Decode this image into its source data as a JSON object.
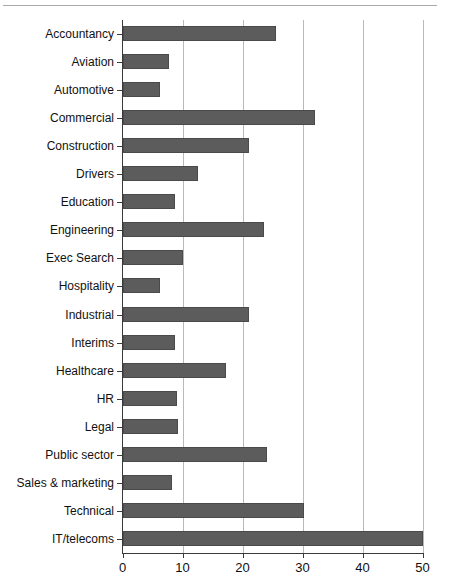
{
  "chart_data": {
    "type": "bar",
    "orientation": "horizontal",
    "title": "",
    "xlabel": "",
    "ylabel": "",
    "xlim": [
      0,
      50
    ],
    "xticks": [
      0,
      10,
      20,
      30,
      40,
      50
    ],
    "xtick_labels": [
      "0",
      "10",
      "20",
      "30",
      "40",
      "50"
    ],
    "grid": "vertical",
    "legend": "none",
    "bar_color": "#5c5c5c",
    "gridline_color": "#b9b9b9",
    "axis_color": "#3a3a3a",
    "categories": [
      "Accountancy",
      "Aviation",
      "Automotive",
      "Commercial",
      "Construction",
      "Drivers",
      "Education",
      "Engineering",
      "Exec Search",
      "Hospitality",
      "Industrial",
      "Interims",
      "Healthcare",
      "HR",
      "Legal",
      "Public sector",
      "Sales & marketing",
      "Technical",
      "IT/telecoms"
    ],
    "values": [
      25.5,
      7.8,
      6.3,
      32,
      21,
      12.5,
      8.8,
      23.5,
      10,
      6.3,
      21,
      8.8,
      17.3,
      9,
      9.2,
      24,
      8.3,
      30.3,
      50
    ]
  }
}
